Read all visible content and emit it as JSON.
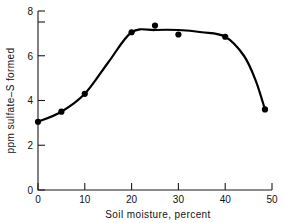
{
  "chart_data": {
    "type": "scatter",
    "title": "",
    "subtitle": "",
    "xlabel": "Soil  moisture,  percent",
    "ylabel": "ppm sulfate–S formed",
    "xlim": [
      0,
      50
    ],
    "ylim": [
      0,
      8
    ],
    "xticks": [
      0,
      10,
      20,
      30,
      40,
      50
    ],
    "xtick_labels": [
      "0",
      "10",
      "20",
      "30",
      "40",
      "50"
    ],
    "yticks": [
      0,
      2,
      4,
      6,
      8
    ],
    "ytick_labels": [
      "0",
      "2",
      "4",
      "6",
      "8"
    ],
    "grid": false,
    "legend": null,
    "series": [
      {
        "name": "sulfate-S formed",
        "marker": "filled-circle",
        "line": "smooth-fitted-curve",
        "x": [
          0,
          5,
          10,
          20,
          25,
          30,
          40,
          48.5
        ],
        "y": [
          3.05,
          3.5,
          4.3,
          7.05,
          7.35,
          6.95,
          6.85,
          3.6
        ]
      }
    ],
    "fitted_curve": {
      "description": "smooth hand-drawn trend curve through the points, rising from 3.05 at 0% to a plateau near 7.1 between 20% and 40%, then falling steeply to 3.6 at 48.5%",
      "x": [
        0,
        5,
        10,
        15,
        20,
        25,
        30,
        35,
        40,
        44,
        46.5,
        48.5
      ],
      "y": [
        3.05,
        3.5,
        4.3,
        5.7,
        7.05,
        7.15,
        7.15,
        7.05,
        6.85,
        6.0,
        4.9,
        3.6
      ]
    },
    "annotations": []
  },
  "axes": {
    "x_axis_name": "Soil moisture axis",
    "y_axis_name": "ppm sulfate-S formed axis"
  }
}
